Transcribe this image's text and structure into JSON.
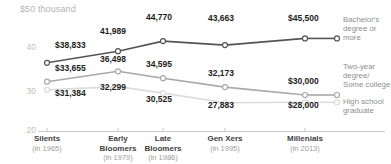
{
  "chart_data": {
    "type": "line",
    "title": "",
    "ylabel": "$50 thousand",
    "xlabel": "",
    "ylim": [
      20000,
      50000
    ],
    "yticks": [
      40,
      30,
      20
    ],
    "ytick_labels": [
      "40",
      "30",
      "20"
    ],
    "grid": false,
    "legend_position": "right",
    "categories": [
      "Silents",
      "Early Bloomers",
      "Late Bloomers",
      "Gen Xers",
      "Millenials"
    ],
    "category_sublabels": [
      "(in 1965)",
      "(in 1979)",
      "(in 1986)",
      "(in 1995)",
      "(in 2013)"
    ],
    "series": [
      {
        "name": "Bachelor's degree or more",
        "color": "#555555",
        "values": [
          38833,
          41989,
          44770,
          43663,
          45500
        ],
        "labels": [
          "$38,833",
          "41,989",
          "44,770",
          "43,663",
          "$45,500"
        ]
      },
      {
        "name": "Two-year degree/ Some college",
        "color": "#a9a9a9",
        "values": [
          33655,
          36498,
          34595,
          32173,
          30000
        ],
        "labels": [
          "$33,655",
          "36,498",
          "34,595",
          "32,173",
          "$30,000"
        ]
      },
      {
        "name": "High school graduate",
        "color": "#dcdcdc",
        "values": [
          31384,
          32299,
          30525,
          27883,
          28000
        ],
        "labels": [
          "$31,384",
          "32,299",
          "30,525",
          "27,883",
          "$28,000"
        ]
      }
    ]
  },
  "axis": {
    "y_unit_label": "$50 thousand",
    "tick_40": "40",
    "tick_30": "30",
    "tick_20": "20"
  },
  "legend": {
    "items": [
      {
        "line1": "Bachelor's",
        "line2": "degree or",
        "line3": "more"
      },
      {
        "line1": "Two-year",
        "line2": "degree/",
        "line3": "Some college"
      },
      {
        "line1": "High school",
        "line2": "graduate",
        "line3": ""
      }
    ]
  },
  "xaxis": {
    "c0_name": "Silents",
    "c0_sub": "(in 1965)",
    "c1_name": "Early",
    "c1_name2": "Bloomers",
    "c1_sub": "(in 1979)",
    "c2_name": "Late",
    "c2_name2": "Bloomers",
    "c2_sub": "(in 1986)",
    "c3_name": "Gen Xers",
    "c3_sub": "(in 1995)",
    "c4_name": "Millenials",
    "c4_sub": "(in 2013)"
  },
  "labels": {
    "s0p0": "$38,833",
    "s0p1": "41,989",
    "s0p2": "44,770",
    "s0p3": "43,663",
    "s0p4": "$45,500",
    "s1p0": "$33,655",
    "s1p1": "36,498",
    "s1p2": "34,595",
    "s1p3": "32,173",
    "s1p4": "$30,000",
    "s2p0": "$31,384",
    "s2p1": "32,299",
    "s2p2": "30,525",
    "s2p3": "27,883",
    "s2p4": "$28,000"
  }
}
